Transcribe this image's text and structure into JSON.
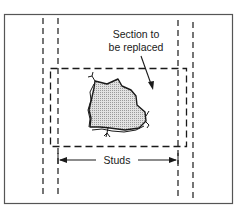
{
  "diagram": {
    "labels": {
      "section_line1": "Section to",
      "section_line2": "be replaced",
      "studs": "Studs"
    },
    "colors": {
      "line": "#1a1a1a",
      "frame": "#555555",
      "patch_fill": "#c8c8c8",
      "background": "#ffffff"
    },
    "elements": [
      {
        "id": "wall-frame",
        "type": "rectangle"
      },
      {
        "id": "stud-left-outer",
        "type": "dashed-line"
      },
      {
        "id": "stud-left-inner",
        "type": "dashed-line"
      },
      {
        "id": "stud-right-inner",
        "type": "dashed-line"
      },
      {
        "id": "stud-right-outer",
        "type": "dashed-line"
      },
      {
        "id": "cut-outline",
        "type": "dashed-rectangle"
      },
      {
        "id": "damaged-area",
        "type": "shaded-polygon"
      },
      {
        "id": "section-arrow",
        "type": "arrow"
      },
      {
        "id": "studs-dimension",
        "type": "double-arrow"
      }
    ]
  }
}
